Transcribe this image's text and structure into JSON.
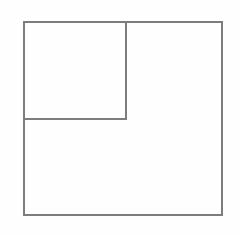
{
  "figure": {
    "title": "",
    "caption": "",
    "background_color": "#fefefe",
    "stroke_color": "#7d7d7d",
    "stroke_width": 1.2,
    "fill_color": "none",
    "canvas": {
      "width": 241,
      "height": 236
    },
    "shapes": [
      {
        "name": "outer-square",
        "type": "rectangle",
        "x": 24,
        "y": 22,
        "width": 198,
        "height": 193,
        "label": ""
      },
      {
        "name": "inner-square",
        "type": "rectangle",
        "x": 24,
        "y": 22,
        "width": 102,
        "height": 97,
        "label": ""
      }
    ],
    "segments": [
      {
        "name": "inner-vertical-divider",
        "x1": 126,
        "y1": 22,
        "x2": 126,
        "y2": 119
      },
      {
        "name": "inner-horizontal-divider",
        "x1": 24,
        "y1": 119,
        "x2": 126,
        "y2": 119
      }
    ],
    "regions": [
      {
        "name": "upper-left-square-region",
        "label": ""
      },
      {
        "name": "l-shaped-region",
        "label": ""
      }
    ]
  }
}
